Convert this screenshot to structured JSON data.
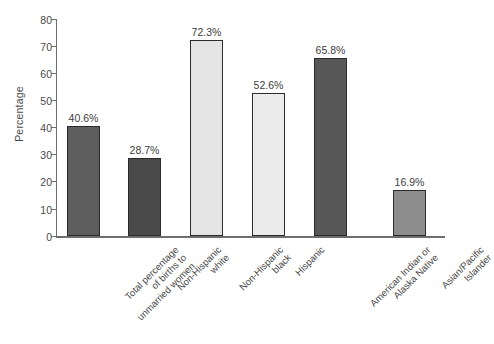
{
  "chart_data": {
    "type": "bar",
    "title": "",
    "xlabel": "",
    "ylabel": "Percentage",
    "ylim": [
      0,
      80
    ],
    "ytick_step": 10,
    "grid": false,
    "legend": "none",
    "yticks": [
      "80",
      "70",
      "60",
      "50",
      "40",
      "30",
      "20",
      "10",
      "0"
    ],
    "categories": [
      "Total percentage of births to unmarried women",
      "Non-Hispanic white",
      "Non-Hispanic black",
      "Hispanic",
      "American Indian or Alaska Native",
      "Asian/Pacific Islander"
    ],
    "category_lines": [
      [
        "Total percentage",
        "of births to",
        "unmarried women"
      ],
      [
        "Non-Hispanic",
        "white"
      ],
      [
        "Non-Hispanic",
        "black"
      ],
      [
        "Hispanic"
      ],
      [
        "American Indian or",
        "Alaska Native"
      ],
      [
        "Asian/Pacific",
        "Islander"
      ]
    ],
    "values": [
      40.6,
      28.7,
      72.3,
      52.6,
      65.8,
      16.9
    ],
    "value_labels": [
      "40.6%",
      "28.7%",
      "72.3%",
      "52.6%",
      "65.8%",
      "16.9%"
    ],
    "bar_colors": [
      "#5e5e5e",
      "#4a4a4a",
      "#e4e4e4",
      "#ececec",
      "#585858",
      "#8d8d8d"
    ],
    "bar_border_color": "#2b2b2b",
    "axis_color": "#6e6e6e"
  }
}
